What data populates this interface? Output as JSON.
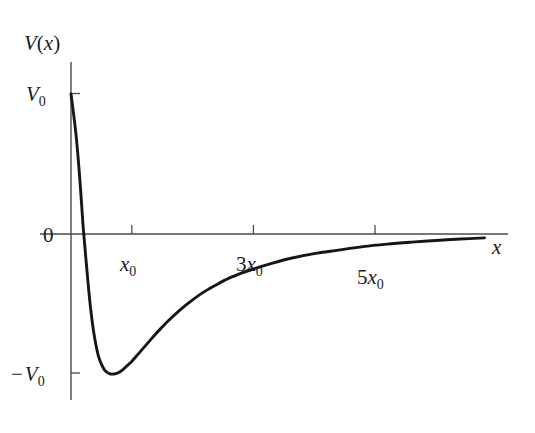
{
  "figure": {
    "title": "",
    "background_color": "#ffffff",
    "axis_color": "#4a4a4a",
    "curve_color": "#161616",
    "text_color": "#1c1c1c"
  },
  "labels": {
    "y_axis_title_main": "V",
    "y_axis_title_paren_open": "(",
    "y_axis_title_var": "x",
    "y_axis_title_paren_close": ")",
    "y_axis_title_full": "V(x)",
    "x_axis_title": "x",
    "y_tick_top_main": "V",
    "y_tick_top_sub": "0",
    "y_tick_top_full": "V0",
    "y_tick_zero": "0",
    "y_tick_bottom_minus": "−",
    "y_tick_bottom_main": "V",
    "y_tick_bottom_sub": "0",
    "y_tick_bottom_full": "-V0",
    "x_tick_1_main": "x",
    "x_tick_1_sub": "0",
    "x_tick_1_full": "x0",
    "x_tick_2_coef": "3",
    "x_tick_2_main": "x",
    "x_tick_2_sub": "0",
    "x_tick_2_full": "3x0",
    "x_tick_3_coef": "5",
    "x_tick_3_main": "x",
    "x_tick_3_sub": "0",
    "x_tick_3_full": "5x0"
  },
  "chart_data": {
    "type": "line",
    "title": "",
    "xlabel": "x",
    "ylabel": "V(x)",
    "grid": false,
    "legend": null,
    "xlim": [
      0,
      7.2
    ],
    "ylim": [
      -1.35,
      1.35
    ],
    "x_tick_values": [
      1,
      3,
      5
    ],
    "x_tick_labels": [
      "x0",
      "3x0",
      "5x0"
    ],
    "y_tick_values": [
      1,
      0,
      -1
    ],
    "y_tick_labels": [
      "V0",
      "0",
      "-V0"
    ],
    "annotations": [
      {
        "text": "V(x)",
        "role": "y-axis-title"
      },
      {
        "text": "x",
        "role": "x-axis-title"
      }
    ],
    "series": [
      {
        "name": "V(x)",
        "description": "Lennard-Jones type potential: starts at V0 at x=0, crosses zero near x=0.21*x0, reaches minimum -V0 at x=x0, then rises asymptotically toward 0",
        "x": [
          0.0,
          0.08,
          0.14,
          0.2,
          0.21,
          0.25,
          0.3,
          0.35,
          0.4,
          0.45,
          0.5,
          0.55,
          0.6,
          0.65,
          0.7,
          0.75,
          0.8,
          0.85,
          0.9,
          0.95,
          1.0,
          1.1,
          1.2,
          1.3,
          1.4,
          1.5,
          1.6,
          1.8,
          2.0,
          2.2,
          2.4,
          2.6,
          2.8,
          3.0,
          3.3,
          3.6,
          4.0,
          4.4,
          4.8,
          5.2,
          5.6,
          6.0,
          6.4,
          6.8
        ],
        "y": [
          1.0,
          0.72,
          0.42,
          0.05,
          0.0,
          -0.2,
          -0.44,
          -0.63,
          -0.77,
          -0.87,
          -0.93,
          -0.97,
          -0.99,
          -1.0,
          -1.0,
          -0.995,
          -0.985,
          -0.97,
          -0.95,
          -0.93,
          -0.91,
          -0.86,
          -0.81,
          -0.76,
          -0.71,
          -0.665,
          -0.62,
          -0.54,
          -0.47,
          -0.41,
          -0.36,
          -0.315,
          -0.28,
          -0.25,
          -0.21,
          -0.175,
          -0.14,
          -0.115,
          -0.09,
          -0.072,
          -0.058,
          -0.046,
          -0.036,
          -0.028
        ]
      }
    ]
  },
  "geometry": {
    "origin_x_px": 71,
    "origin_y_px": 234,
    "x_unit_px": 60.8,
    "y_unit_px": 140,
    "y_axis_top_px": 62,
    "y_axis_bottom_px": 400,
    "x_axis_right_px": 508,
    "tick_length_px": 9
  }
}
